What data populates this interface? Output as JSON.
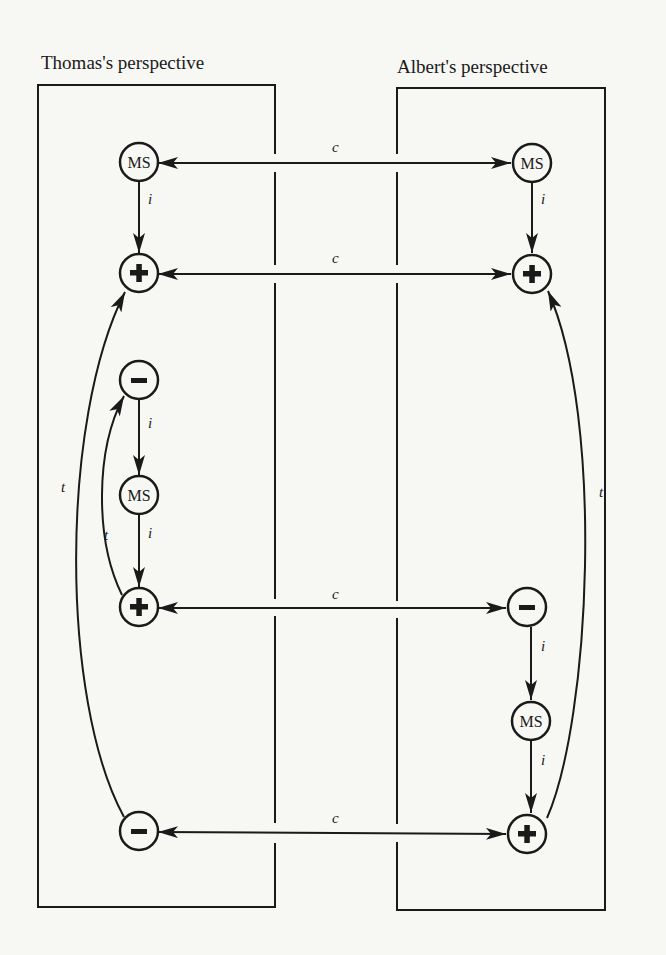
{
  "diagram": {
    "colors": {
      "ink": "#1a1a1a",
      "background": "#f7f7f4"
    },
    "panels": [
      {
        "id": "left",
        "title": "Thomas's perspective"
      },
      {
        "id": "right",
        "title": "Albert's perspective"
      }
    ],
    "nodes": {
      "L1": {
        "label": "MS",
        "type": "ms",
        "panel": "left"
      },
      "L2": {
        "label": "+",
        "type": "plus",
        "panel": "left"
      },
      "L3": {
        "label": "−",
        "type": "minus",
        "panel": "left"
      },
      "L4": {
        "label": "MS",
        "type": "ms",
        "panel": "left"
      },
      "L5": {
        "label": "+",
        "type": "plus",
        "panel": "left"
      },
      "L6": {
        "label": "−",
        "type": "minus",
        "panel": "left"
      },
      "R1": {
        "label": "MS",
        "type": "ms",
        "panel": "right"
      },
      "R2": {
        "label": "+",
        "type": "plus",
        "panel": "right"
      },
      "R3": {
        "label": "−",
        "type": "minus",
        "panel": "right"
      },
      "R4": {
        "label": "MS",
        "type": "ms",
        "panel": "right"
      },
      "R5": {
        "label": "+",
        "type": "plus",
        "panel": "right"
      }
    },
    "edges": [
      {
        "from": "L1",
        "to": "R1",
        "label": "c",
        "kind": "bidirectional"
      },
      {
        "from": "L2",
        "to": "R2",
        "label": "c",
        "kind": "bidirectional"
      },
      {
        "from": "L5",
        "to": "R3",
        "label": "c",
        "kind": "bidirectional"
      },
      {
        "from": "L6",
        "to": "R5",
        "label": "c",
        "kind": "bidirectional"
      },
      {
        "from": "L1",
        "to": "L2",
        "label": "i",
        "kind": "directed"
      },
      {
        "from": "L3",
        "to": "L4",
        "label": "i",
        "kind": "directed"
      },
      {
        "from": "L4",
        "to": "L5",
        "label": "i",
        "kind": "directed"
      },
      {
        "from": "R1",
        "to": "R2",
        "label": "i",
        "kind": "directed"
      },
      {
        "from": "R3",
        "to": "R4",
        "label": "i",
        "kind": "directed"
      },
      {
        "from": "R4",
        "to": "R5",
        "label": "i",
        "kind": "directed"
      },
      {
        "from": "L5",
        "to": "L3",
        "label": "t",
        "kind": "curved"
      },
      {
        "from": "L6",
        "to": "L2",
        "label": "t",
        "kind": "curved"
      },
      {
        "from": "R5",
        "to": "R2",
        "label": "t",
        "kind": "curved"
      }
    ],
    "labels": {
      "c": "c",
      "i": "i",
      "t": "t",
      "ms": "MS"
    }
  }
}
